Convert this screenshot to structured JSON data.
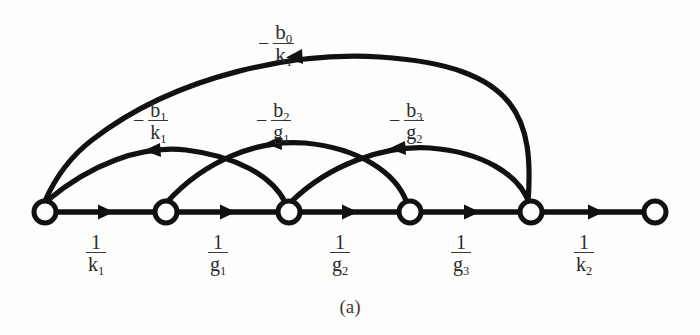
{
  "figure": {
    "caption": "(a)",
    "type": "signal-flow-graph",
    "ink_color": "#111111",
    "background_color": "#fdfdfc",
    "label_color": "#2b2b2b"
  },
  "nodes": [
    {
      "id": "n1",
      "x": 45,
      "y": 212,
      "r": 11
    },
    {
      "id": "n2",
      "x": 166,
      "y": 212,
      "r": 11
    },
    {
      "id": "n3",
      "x": 289,
      "y": 212,
      "r": 11
    },
    {
      "id": "n4",
      "x": 410,
      "y": 212,
      "r": 11
    },
    {
      "id": "n5",
      "x": 531,
      "y": 212,
      "r": 11
    },
    {
      "id": "n6",
      "x": 655,
      "y": 212,
      "r": 11
    }
  ],
  "forward_edges": [
    {
      "from": "n1",
      "to": "n2",
      "gain_num": "1",
      "gain_den": "k",
      "gain_den_sub": "1",
      "label_x": 92,
      "label_y": 232
    },
    {
      "from": "n2",
      "to": "n3",
      "gain_num": "1",
      "gain_den": "g",
      "gain_den_sub": "1",
      "label_x": 214,
      "label_y": 232
    },
    {
      "from": "n3",
      "to": "n4",
      "gain_num": "1",
      "gain_den": "g",
      "gain_den_sub": "2",
      "label_x": 336,
      "label_y": 232
    },
    {
      "from": "n4",
      "to": "n5",
      "gain_num": "1",
      "gain_den": "g",
      "gain_den_sub": "3",
      "label_x": 457,
      "label_y": 232
    },
    {
      "from": "n5",
      "to": "n6",
      "gain_num": "1",
      "gain_den": "k",
      "gain_den_sub": "2",
      "label_x": 580,
      "label_y": 232
    }
  ],
  "feedback_edges": [
    {
      "id": "outer-arc",
      "from": "n5",
      "to": "n1",
      "sign": "−",
      "gain_num": "b",
      "gain_num_sub": "0",
      "gain_den": "k",
      "gain_den_sub": "1",
      "label_x": 288,
      "label_y": 22
    },
    {
      "id": "arc-b1",
      "from": "n3",
      "to": "n1",
      "sign": "−",
      "gain_num": "b",
      "gain_num_sub": "1",
      "gain_den": "k",
      "gain_den_sub": "1",
      "label_x": 140,
      "label_y": 100
    },
    {
      "id": "arc-b2",
      "from": "n4",
      "to": "n2",
      "sign": "−",
      "gain_num": "b",
      "gain_num_sub": "2",
      "gain_den": "g",
      "gain_den_sub": "1",
      "label_x": 262,
      "label_y": 100
    },
    {
      "id": "arc-b3",
      "from": "n5",
      "to": "n3",
      "sign": "−",
      "gain_num": "b",
      "gain_num_sub": "3",
      "gain_den": "g",
      "gain_den_sub": "2",
      "label_x": 395,
      "label_y": 100
    }
  ]
}
